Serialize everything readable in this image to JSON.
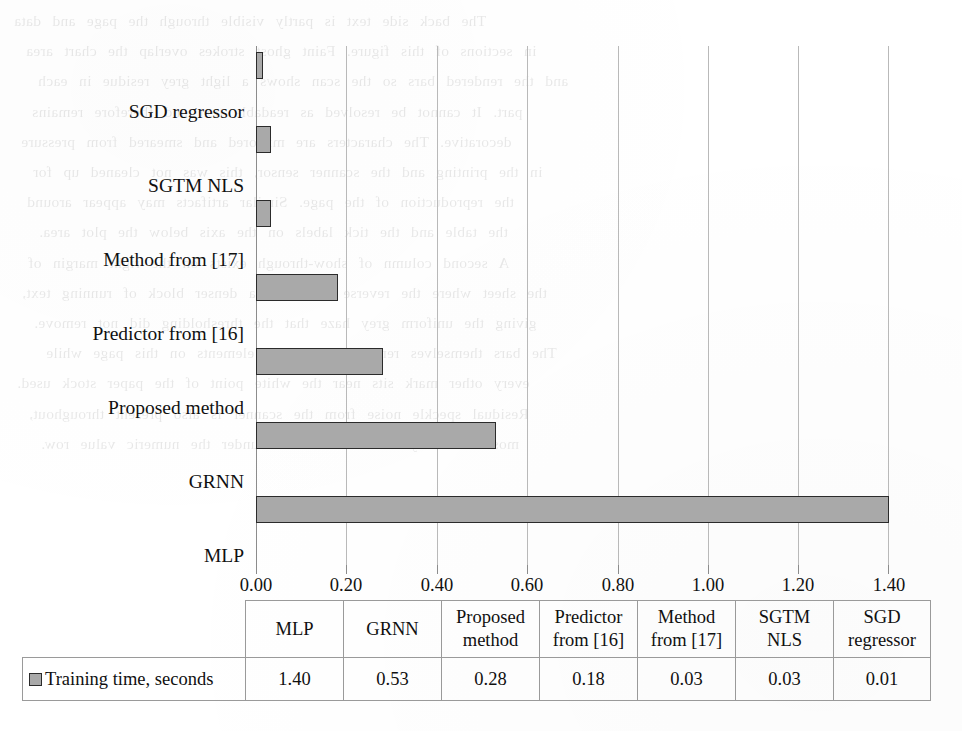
{
  "chart_data": {
    "type": "bar",
    "orientation": "horizontal",
    "title": "",
    "xlabel": "",
    "ylabel": "",
    "categories": [
      "MLP",
      "GRNN",
      "Proposed method",
      "Predictor from [16]",
      "Method from [17]",
      "SGTM NLS",
      "SGD regressor"
    ],
    "series": [
      {
        "name": "Training time, seconds",
        "values": [
          1.4,
          0.53,
          0.28,
          0.18,
          0.03,
          0.03,
          0.01
        ]
      }
    ],
    "xlim": [
      0.0,
      1.4
    ],
    "xticks": [
      0.0,
      0.2,
      0.4,
      0.6,
      0.8,
      1.0,
      1.2,
      1.4
    ],
    "xtick_labels": [
      "0.00",
      "0.20",
      "0.40",
      "0.60",
      "0.80",
      "1.00",
      "1.20",
      "1.40"
    ],
    "grid": "vertical",
    "legend_position": "data-table-row",
    "bar_color": "#a9a9a9",
    "bar_border_color": "#2b2b2b",
    "gridline_color": "#b9b9b9"
  },
  "category_labels": {
    "sgd_regressor": "SGD regressor",
    "sgtm_nls": "SGTM NLS",
    "method_17": "Method from [17]",
    "predictor_16": "Predictor from [16]",
    "proposed_method": "Proposed method",
    "grnn": "GRNN",
    "mlp": "MLP"
  },
  "axis": {
    "ticks": [
      "0.00",
      "0.20",
      "0.40",
      "0.60",
      "0.80",
      "1.00",
      "1.20",
      "1.40"
    ]
  },
  "data_table": {
    "legend_label": "Training time, seconds",
    "headers": [
      {
        "line1": "MLP",
        "line2": ""
      },
      {
        "line1": "GRNN",
        "line2": ""
      },
      {
        "line1": "Proposed",
        "line2": "method"
      },
      {
        "line1": "Predictor",
        "line2": "from [16]"
      },
      {
        "line1": "Method",
        "line2": "from [17]"
      },
      {
        "line1": "SGTM",
        "line2": "NLS"
      },
      {
        "line1": "SGD",
        "line2": "regressor"
      }
    ],
    "values": [
      "1.40",
      "0.53",
      "0.28",
      "0.18",
      "0.03",
      "0.03",
      "0.01"
    ]
  },
  "background_bleed": {
    "lines": [
      "The back side text is partly visible through the page and data",
      "in sections of this figure. Faint ghost strokes overlap the chart area",
      "and the rendered bars so the scan shows a light grey residue in each",
      "part. It cannot be resolved as readable text and therefore remains",
      "decorative. The characters are mirrored and smeared from pressure",
      "in the printing and the scanner sensor, this was not cleaned up for",
      "the reproduction of the page. Similar artifacts may appear around",
      "the table and the tick labels on the axis below the plot area.",
      "A second column of show-through exists on the right margin of",
      "the sheet where the reverse page had a denser block of running text,",
      "giving the uniform grey haze that the thresholding did not remove.",
      "The bars themselves remain the darkest elements on this page while",
      "every other mark sits near the white point of the paper stock used.",
      "Residual speckle noise from the scanner is also present throughout,",
      "most noticeably in the lower half under the numeric value row."
    ]
  }
}
